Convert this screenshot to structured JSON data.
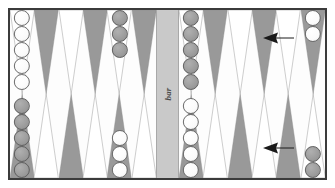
{
  "board": {
    "bar_label": "bar",
    "colors": {
      "frame": "#3b3b3b",
      "board_background": "#fdfdfd",
      "point_dark": "#999999",
      "point_light": "#ffffff",
      "bar_background": "#c9c9c9",
      "checker_white": "#ffffff",
      "checker_gray": "#9c9c9c",
      "arrow": "#1a1a1a"
    },
    "quadrants": [
      {
        "name": "top-left",
        "points": [
          {
            "index": 1,
            "triangle": "light",
            "checkers": {
              "color": "white",
              "count": 5
            }
          },
          {
            "index": 2,
            "triangle": "dark",
            "checkers": {
              "color": "none",
              "count": 0
            }
          },
          {
            "index": 3,
            "triangle": "light",
            "checkers": {
              "color": "none",
              "count": 0
            }
          },
          {
            "index": 4,
            "triangle": "dark",
            "checkers": {
              "color": "none",
              "count": 0
            }
          },
          {
            "index": 5,
            "triangle": "light",
            "checkers": {
              "color": "gray",
              "count": 3
            }
          },
          {
            "index": 6,
            "triangle": "dark",
            "checkers": {
              "color": "none",
              "count": 0
            }
          }
        ]
      },
      {
        "name": "top-right",
        "points": [
          {
            "index": 7,
            "triangle": "light",
            "checkers": {
              "color": "gray",
              "count": 5
            }
          },
          {
            "index": 8,
            "triangle": "dark",
            "checkers": {
              "color": "none",
              "count": 0
            }
          },
          {
            "index": 9,
            "triangle": "light",
            "checkers": {
              "color": "none",
              "count": 0
            }
          },
          {
            "index": 10,
            "triangle": "dark",
            "checkers": {
              "color": "none",
              "count": 0
            }
          },
          {
            "index": 11,
            "triangle": "light",
            "checkers": {
              "color": "none",
              "count": 0
            }
          },
          {
            "index": 12,
            "triangle": "dark",
            "checkers": {
              "color": "white",
              "count": 2
            }
          }
        ]
      },
      {
        "name": "bottom-left",
        "points": [
          {
            "index": 13,
            "triangle": "dark",
            "checkers": {
              "color": "gray",
              "count": 5
            }
          },
          {
            "index": 14,
            "triangle": "light",
            "checkers": {
              "color": "none",
              "count": 0
            }
          },
          {
            "index": 15,
            "triangle": "dark",
            "checkers": {
              "color": "none",
              "count": 0
            }
          },
          {
            "index": 16,
            "triangle": "light",
            "checkers": {
              "color": "none",
              "count": 0
            }
          },
          {
            "index": 17,
            "triangle": "dark",
            "checkers": {
              "color": "white",
              "count": 3
            }
          },
          {
            "index": 18,
            "triangle": "light",
            "checkers": {
              "color": "none",
              "count": 0
            }
          }
        ]
      },
      {
        "name": "bottom-right",
        "points": [
          {
            "index": 19,
            "triangle": "dark",
            "checkers": {
              "color": "white",
              "count": 5
            }
          },
          {
            "index": 20,
            "triangle": "light",
            "checkers": {
              "color": "none",
              "count": 0
            }
          },
          {
            "index": 21,
            "triangle": "dark",
            "checkers": {
              "color": "none",
              "count": 0
            }
          },
          {
            "index": 22,
            "triangle": "light",
            "checkers": {
              "color": "none",
              "count": 0
            }
          },
          {
            "index": 23,
            "triangle": "dark",
            "checkers": {
              "color": "none",
              "count": 0
            }
          },
          {
            "index": 24,
            "triangle": "light",
            "checkers": {
              "color": "gray",
              "count": 2
            }
          }
        ]
      }
    ],
    "move_arrows": [
      {
        "name": "top-move-arrow",
        "direction": "left",
        "from_point": 12,
        "half": "top"
      },
      {
        "name": "bottom-move-arrow",
        "direction": "left",
        "from_point": 24,
        "half": "bottom"
      }
    ]
  }
}
